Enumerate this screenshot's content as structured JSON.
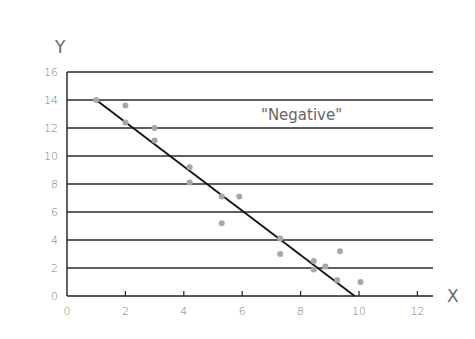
{
  "chart_data": {
    "type": "scatter",
    "title": "",
    "annotation": "\"Negative\"",
    "xlabel": "X",
    "ylabel": "Y",
    "xlim": [
      0,
      12
    ],
    "ylim": [
      0,
      16
    ],
    "xticks": [
      0,
      2,
      4,
      6,
      8,
      10,
      12
    ],
    "yticks": [
      0,
      2,
      4,
      6,
      8,
      10,
      12,
      14,
      16
    ],
    "grid": "horizontal",
    "legend": "none",
    "series": [
      {
        "name": "data points",
        "color": "#a8a8a8",
        "points": [
          {
            "x": 1.0,
            "y": 14.0
          },
          {
            "x": 2.0,
            "y": 13.6
          },
          {
            "x": 2.0,
            "y": 12.4
          },
          {
            "x": 3.0,
            "y": 12.0
          },
          {
            "x": 3.0,
            "y": 11.1
          },
          {
            "x": 4.2,
            "y": 9.2
          },
          {
            "x": 4.2,
            "y": 8.1
          },
          {
            "x": 5.3,
            "y": 7.1
          },
          {
            "x": 5.9,
            "y": 7.1
          },
          {
            "x": 5.3,
            "y": 5.2
          },
          {
            "x": 7.3,
            "y": 4.1
          },
          {
            "x": 7.3,
            "y": 3.0
          },
          {
            "x": 9.35,
            "y": 3.2
          },
          {
            "x": 8.45,
            "y": 2.5
          },
          {
            "x": 8.45,
            "y": 1.9
          },
          {
            "x": 8.85,
            "y": 2.1
          },
          {
            "x": 9.25,
            "y": 1.15
          },
          {
            "x": 10.05,
            "y": 1.0
          }
        ]
      },
      {
        "name": "trend line",
        "type": "line",
        "color": "#111111",
        "points": [
          {
            "x": 1.0,
            "y": 14.0
          },
          {
            "x": 9.85,
            "y": 0.0
          }
        ]
      }
    ]
  },
  "layout": {
    "plot_left": 67,
    "plot_right": 433,
    "plot_top": 72,
    "plot_bottom": 296,
    "x_px_per_unit": 29.2,
    "y_px_per_unit": 14.0
  }
}
